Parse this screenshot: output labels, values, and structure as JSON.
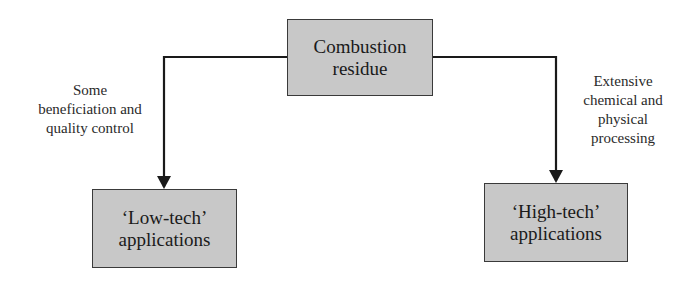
{
  "diagram": {
    "nodes": {
      "source": {
        "lines": [
          "Combustion",
          "residue"
        ]
      },
      "low": {
        "lines": [
          "‘Low-tech’",
          "applications"
        ]
      },
      "high": {
        "lines": [
          "‘High-tech’",
          "applications"
        ]
      }
    },
    "edges": {
      "to_low": {
        "from": "source",
        "to": "low",
        "lines": [
          "Some",
          "beneficiation and",
          "quality control"
        ]
      },
      "to_high": {
        "from": "source",
        "to": "high",
        "lines": [
          "Extensive",
          "chemical and",
          "physical",
          "processing"
        ]
      }
    },
    "colors": {
      "box_fill": "#c8c8c8",
      "line": "#1a1a1a"
    }
  }
}
